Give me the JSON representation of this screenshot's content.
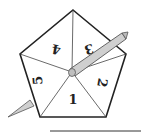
{
  "diagram": {
    "sections": [
      {
        "label": "1",
        "x": 73,
        "y": 104,
        "rotate": 0
      },
      {
        "label": "2",
        "x": 98,
        "y": 82,
        "rotate": 100
      },
      {
        "label": "3",
        "x": 88,
        "y": 45,
        "rotate": 170
      },
      {
        "label": "4",
        "x": 57,
        "y": 45,
        "rotate": 190
      },
      {
        "label": "5",
        "x": 42,
        "y": 80,
        "rotate": 260
      }
    ],
    "colors": {
      "outline": "#222222",
      "divider": "#444444",
      "pencil_fill": "#c8c8c8",
      "pencil_edge": "#555555",
      "baseline": "#333333"
    }
  }
}
